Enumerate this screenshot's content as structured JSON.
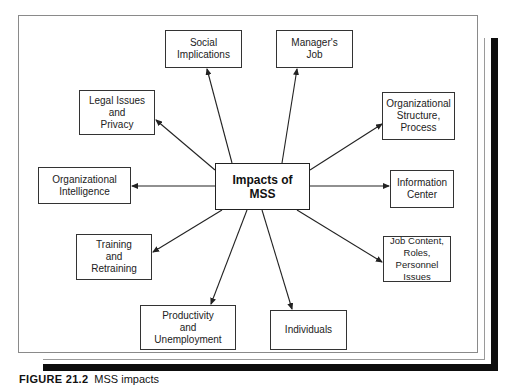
{
  "diagram": {
    "type": "hub-and-spoke",
    "center": {
      "label": "Impacts of\nMSS"
    },
    "nodes": [
      {
        "id": "social",
        "label": "Social\nImplications"
      },
      {
        "id": "manager",
        "label": "Manager's\nJob"
      },
      {
        "id": "legal",
        "label": "Legal Issues\nand\nPrivacy"
      },
      {
        "id": "org-structure",
        "label": "Organizational\nStructure,\nProcess"
      },
      {
        "id": "org-intelligence",
        "label": "Organizational\nIntelligence"
      },
      {
        "id": "info-center",
        "label": "Information\nCenter"
      },
      {
        "id": "training",
        "label": "Training\nand\nRetraining"
      },
      {
        "id": "job-content",
        "label": "Job Content,\nRoles, Personnel\nIssues"
      },
      {
        "id": "productivity",
        "label": "Productivity\nand\nUnemployment"
      },
      {
        "id": "individuals",
        "label": "Individuals"
      }
    ],
    "edges_direction": "center-to-node"
  },
  "caption": {
    "figure_label": "FIGURE 21.2",
    "text": "MSS impacts"
  },
  "colors": {
    "line": "#222222",
    "frame": "#8a8a8a",
    "shadow": "#0d0d0d",
    "background": "#ffffff"
  }
}
